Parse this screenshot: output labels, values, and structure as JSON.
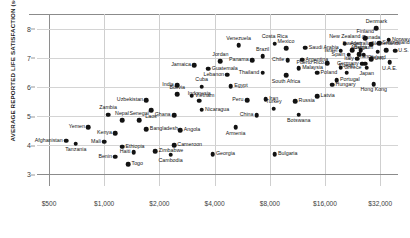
{
  "chart_data": {
    "type": "scatter",
    "title": "",
    "xlabel": "",
    "ylabel": "AVERAGE REPORTED LIFE SATISFACTION (scale 0–10)",
    "x_scale": "log",
    "x_ticks": [
      "$500",
      "$1,000",
      "$2,000",
      "$4,000",
      "$8,000",
      "$16,000",
      "$32,000"
    ],
    "x_tick_values": [
      500,
      1000,
      2000,
      4000,
      8000,
      16000,
      32000
    ],
    "xlim": [
      430,
      40000
    ],
    "y_ticks": [
      "8",
      "7",
      "6",
      "5",
      "4",
      "3"
    ],
    "y_tick_values": [
      8,
      7,
      6,
      5,
      4,
      3
    ],
    "ylim": [
      2.6,
      8.5
    ],
    "grid": true,
    "legend": "none",
    "points": [
      {
        "label": "Denmark",
        "x": 30500,
        "y": 8.02,
        "pos": "t"
      },
      {
        "label": "Finland",
        "x": 26500,
        "y": 7.66,
        "pos": "t"
      },
      {
        "label": "Norway",
        "x": 35500,
        "y": 7.62,
        "pos": "l"
      },
      {
        "label": "New Zealand",
        "x": 20500,
        "y": 7.48,
        "pos": "t"
      },
      {
        "label": "Canada",
        "x": 28500,
        "y": 7.47,
        "pos": "t"
      },
      {
        "label": "Switzerland",
        "x": 31500,
        "y": 7.5,
        "pos": "l"
      },
      {
        "label": "Israel",
        "x": 19500,
        "y": 7.24,
        "pos": "r"
      },
      {
        "label": "Sweden",
        "x": 22500,
        "y": 7.25,
        "pos": "t"
      },
      {
        "label": "Australia",
        "x": 25000,
        "y": 7.25,
        "pos": "t"
      },
      {
        "label": "Ireland",
        "x": 31000,
        "y": 7.2,
        "pos": "b"
      },
      {
        "label": "U.S.",
        "x": 38500,
        "y": 7.24,
        "pos": "l"
      },
      {
        "label": "Netherlands",
        "x": 34500,
        "y": 7.25,
        "pos": "t"
      },
      {
        "label": "Spain",
        "x": 21500,
        "y": 7.1,
        "pos": "r"
      },
      {
        "label": "Austria",
        "x": 24500,
        "y": 7.12,
        "pos": "t"
      },
      {
        "label": "Belgium",
        "x": 26000,
        "y": 7.1,
        "pos": "t"
      },
      {
        "label": "Italy",
        "x": 24000,
        "y": 6.96,
        "pos": "r"
      },
      {
        "label": "U.K.",
        "x": 28500,
        "y": 6.94,
        "pos": "l"
      },
      {
        "label": "Germany",
        "x": 25500,
        "y": 6.8,
        "pos": "r"
      },
      {
        "label": "France",
        "x": 26500,
        "y": 6.8,
        "pos": "t"
      },
      {
        "label": "Japan",
        "x": 27000,
        "y": 6.66,
        "pos": "b"
      },
      {
        "label": "U.A.E.",
        "x": 36000,
        "y": 6.85,
        "pos": "b"
      },
      {
        "label": "Puerto Rico",
        "x": 16500,
        "y": 6.82,
        "pos": "r"
      },
      {
        "label": "Greece",
        "x": 19500,
        "y": 6.66,
        "pos": "l"
      },
      {
        "label": "Kuwait",
        "x": 21000,
        "y": 6.48,
        "pos": "t"
      },
      {
        "label": "Portugal",
        "x": 18500,
        "y": 6.22,
        "pos": "l"
      },
      {
        "label": "Hungary",
        "x": 17500,
        "y": 6.08,
        "pos": "l"
      },
      {
        "label": "Hong Kong",
        "x": 29500,
        "y": 6.1,
        "pos": "b"
      },
      {
        "label": "Latvia",
        "x": 14500,
        "y": 5.68,
        "pos": "l"
      },
      {
        "label": "Venezuela",
        "x": 5400,
        "y": 7.42,
        "pos": "t"
      },
      {
        "label": "Costa Rica",
        "x": 8500,
        "y": 7.48,
        "pos": "t"
      },
      {
        "label": "Mexico",
        "x": 9800,
        "y": 7.32,
        "pos": "t"
      },
      {
        "label": "Saudi Arabia",
        "x": 12500,
        "y": 7.34,
        "pos": "l"
      },
      {
        "label": "Brazil",
        "x": 7300,
        "y": 7.05,
        "pos": "t"
      },
      {
        "label": "Panama",
        "x": 6400,
        "y": 6.92,
        "pos": "r"
      },
      {
        "label": "Chile",
        "x": 10000,
        "y": 6.92,
        "pos": "r"
      },
      {
        "label": "Argentina",
        "x": 12000,
        "y": 6.93,
        "pos": "l"
      },
      {
        "label": "Jordan",
        "x": 4300,
        "y": 6.88,
        "pos": "t"
      },
      {
        "label": "Jamaica",
        "x": 3100,
        "y": 6.75,
        "pos": "r"
      },
      {
        "label": "Guatemala",
        "x": 3700,
        "y": 6.62,
        "pos": "l"
      },
      {
        "label": "Malaysia",
        "x": 11500,
        "y": 6.65,
        "pos": "l"
      },
      {
        "label": "Poland",
        "x": 14500,
        "y": 6.48,
        "pos": "l"
      },
      {
        "label": "Thailand",
        "x": 7300,
        "y": 6.48,
        "pos": "r"
      },
      {
        "label": "South Africa",
        "x": 9800,
        "y": 6.4,
        "pos": "b"
      },
      {
        "label": "Lebanon",
        "x": 4700,
        "y": 6.42,
        "pos": "r"
      },
      {
        "label": "India",
        "x": 2500,
        "y": 6.05,
        "pos": "r"
      },
      {
        "label": "Cuba",
        "x": 3400,
        "y": 6.0,
        "pos": "t"
      },
      {
        "label": "Egypt",
        "x": 4900,
        "y": 6.02,
        "pos": "l"
      },
      {
        "label": "Bolivia",
        "x": 2500,
        "y": 5.75,
        "pos": "t"
      },
      {
        "label": "Vietnam",
        "x": 3000,
        "y": 5.7,
        "pos": "l"
      },
      {
        "label": "Uzbekistan",
        "x": 1700,
        "y": 5.55,
        "pos": "r"
      },
      {
        "label": "Indonesia",
        "x": 3300,
        "y": 5.52,
        "pos": "t"
      },
      {
        "label": "Iran",
        "x": 7600,
        "y": 5.58,
        "pos": "l"
      },
      {
        "label": "Peru",
        "x": 6000,
        "y": 5.55,
        "pos": "r"
      },
      {
        "label": "Russia",
        "x": 11000,
        "y": 5.5,
        "pos": "l"
      },
      {
        "label": "Laos",
        "x": 1800,
        "y": 5.2,
        "pos": "b"
      },
      {
        "label": "Nicaragua",
        "x": 3400,
        "y": 5.22,
        "pos": "l"
      },
      {
        "label": "Zambia",
        "x": 1050,
        "y": 5.05,
        "pos": "t"
      },
      {
        "label": "Ghana",
        "x": 2400,
        "y": 5.03,
        "pos": "r"
      },
      {
        "label": "Turkey",
        "x": 8400,
        "y": 5.25,
        "pos": "t"
      },
      {
        "label": "China",
        "x": 6800,
        "y": 5.02,
        "pos": "r"
      },
      {
        "label": "Botswana",
        "x": 11500,
        "y": 5.05,
        "pos": "b"
      },
      {
        "label": "Nepal",
        "x": 1250,
        "y": 4.85,
        "pos": "t"
      },
      {
        "label": "Senegal",
        "x": 1550,
        "y": 4.85,
        "pos": "t"
      },
      {
        "label": "Bangladesh",
        "x": 1700,
        "y": 4.55,
        "pos": "l"
      },
      {
        "label": "Angola",
        "x": 2600,
        "y": 4.52,
        "pos": "l"
      },
      {
        "label": "Yemen",
        "x": 820,
        "y": 4.62,
        "pos": "r"
      },
      {
        "label": "Armenia",
        "x": 5200,
        "y": 4.62,
        "pos": "b"
      },
      {
        "label": "Kenya",
        "x": 1150,
        "y": 4.42,
        "pos": "r"
      },
      {
        "label": "Mali",
        "x": 1000,
        "y": 4.12,
        "pos": "r"
      },
      {
        "label": "Afghanistan",
        "x": 620,
        "y": 4.15,
        "pos": "r"
      },
      {
        "label": "Tanzania",
        "x": 700,
        "y": 4.05,
        "pos": "b"
      },
      {
        "label": "Ethiopia",
        "x": 1250,
        "y": 3.95,
        "pos": "l"
      },
      {
        "label": "Cameroon",
        "x": 2400,
        "y": 4.0,
        "pos": "l"
      },
      {
        "label": "Haiti",
        "x": 1450,
        "y": 3.75,
        "pos": "r"
      },
      {
        "label": "Zimbabwe",
        "x": 1900,
        "y": 3.8,
        "pos": "l"
      },
      {
        "label": "Benin",
        "x": 1150,
        "y": 3.6,
        "pos": "r"
      },
      {
        "label": "Cambodia",
        "x": 2300,
        "y": 3.68,
        "pos": "b"
      },
      {
        "label": "Georgia",
        "x": 3900,
        "y": 3.7,
        "pos": "l"
      },
      {
        "label": "Togo",
        "x": 1350,
        "y": 3.35,
        "pos": "l"
      },
      {
        "label": "Bulgaria",
        "x": 8500,
        "y": 3.7,
        "pos": "l"
      }
    ]
  }
}
